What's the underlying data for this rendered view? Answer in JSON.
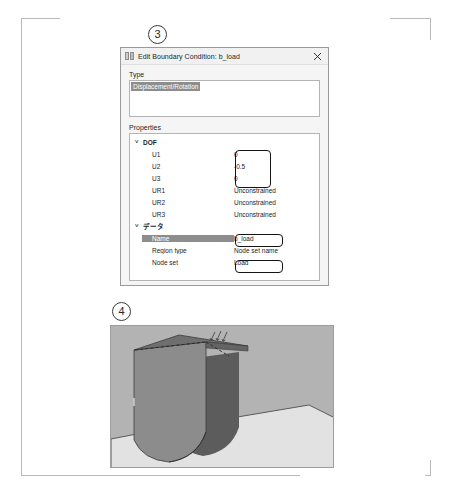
{
  "figure": {
    "markers": [
      {
        "id": "3",
        "label": "3"
      },
      {
        "id": "4",
        "label": "4"
      }
    ]
  },
  "dialog": {
    "title": "Edit Boundary Condition: b_load",
    "app_icon": "abaqus-bc-icon",
    "close_label": "×",
    "type_section": {
      "label": "Type",
      "selected_option": "Displacement/Rotation",
      "options": [
        "Displacement/Rotation"
      ]
    },
    "properties_section": {
      "label": "Properties",
      "groups": [
        {
          "name": "DOF",
          "expanded": true,
          "chevron": "˅",
          "rows": [
            {
              "key": "U1",
              "value": "0"
            },
            {
              "key": "U2",
              "value": "-0.5"
            },
            {
              "key": "U3",
              "value": "0"
            },
            {
              "key": "UR1",
              "value": "Unconstrained"
            },
            {
              "key": "UR2",
              "value": "Unconstrained"
            },
            {
              "key": "UR3",
              "value": "Unconstrained"
            }
          ]
        },
        {
          "name": "データ",
          "expanded": true,
          "chevron": "˅",
          "rows": [
            {
              "key": "Name",
              "value": "b_load",
              "selected": true
            },
            {
              "key": "Region type",
              "value": "Node set name",
              "selected": false
            },
            {
              "key": "Node set",
              "value": "Load",
              "selected": false
            }
          ]
        }
      ]
    },
    "highlights": [
      {
        "id": "dof-values-highlight",
        "target": "U1/U2/U3 values"
      },
      {
        "id": "name-value-highlight",
        "target": "Name value"
      },
      {
        "id": "nodeset-value-highlight",
        "target": "Node set value"
      }
    ]
  },
  "viewport": {
    "name": "model-3d-view",
    "colors": {
      "background": "#b3b3b3",
      "part_front": "#8c8c8c",
      "part_top": "#6e6e6e",
      "part_shadow": "#5a5a5a",
      "ground": "#e0e0e0",
      "edge": "#3a3a3a"
    }
  }
}
